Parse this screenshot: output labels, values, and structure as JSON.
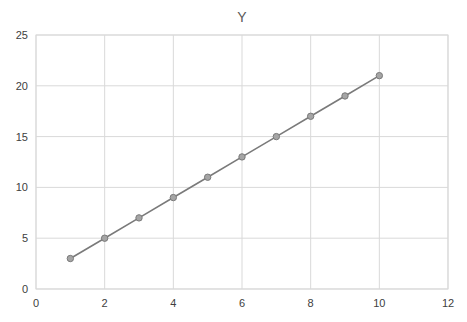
{
  "chart_data": {
    "type": "scatter",
    "title": "Y",
    "xlabel": "",
    "ylabel": "",
    "x": [
      1,
      2,
      3,
      4,
      5,
      6,
      7,
      8,
      9,
      10
    ],
    "series": [
      {
        "name": "Y",
        "values": [
          3,
          5,
          7,
          9,
          11,
          13,
          15,
          17,
          19,
          21
        ],
        "line": true,
        "markers": true,
        "color": "#7a7a7a",
        "marker_color": "#a5a5a5"
      }
    ],
    "xlim": [
      0,
      12
    ],
    "ylim": [
      0,
      25
    ],
    "xticks": [
      0,
      2,
      4,
      6,
      8,
      10,
      12
    ],
    "yticks": [
      0,
      5,
      10,
      15,
      20,
      25
    ],
    "grid": true,
    "legend": "none"
  }
}
